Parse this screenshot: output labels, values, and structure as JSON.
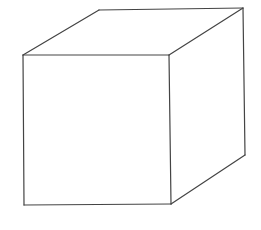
{
  "diagram": {
    "type": "wireframe-cube",
    "stroke_color": "#444444",
    "background": "#ffffff",
    "vertices": {
      "front_top_left": [
        23,
        55
      ],
      "front_top_right": [
        169,
        55
      ],
      "front_bottom_right": [
        171,
        204
      ],
      "front_bottom_left": [
        24,
        205
      ],
      "back_top_left": [
        99,
        10
      ],
      "back_top_right": [
        243,
        8
      ],
      "back_bottom_right": [
        245,
        155
      ]
    }
  }
}
